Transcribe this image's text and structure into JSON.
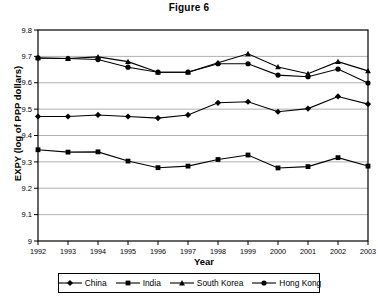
{
  "chart_data": {
    "type": "line",
    "title": "Figure 6",
    "xlabel": "Year",
    "ylabel": "EXPY (log of PPP dollars)",
    "x": [
      1992,
      1993,
      1994,
      1995,
      1996,
      1997,
      1998,
      1999,
      2000,
      2001,
      2002,
      2003
    ],
    "categories": [
      "1992",
      "1993",
      "1994",
      "1995",
      "1996",
      "1997",
      "1998",
      "1999",
      "2000",
      "2001",
      "2002",
      "2003"
    ],
    "xlim": [
      1992,
      2003
    ],
    "ylim": [
      9.0,
      9.8
    ],
    "yticks": [
      "9",
      "9.1",
      "9.2",
      "9.3",
      "9.4",
      "9.5",
      "9.6",
      "9.7",
      "9.8"
    ],
    "ytick_values": [
      9.0,
      9.1,
      9.2,
      9.3,
      9.4,
      9.5,
      9.6,
      9.7,
      9.8
    ],
    "grid": "horizontal",
    "legend_position": "bottom",
    "series": [
      {
        "name": "China",
        "marker": "diamond",
        "color": "#000000",
        "values": [
          9.472,
          9.472,
          9.478,
          9.472,
          9.466,
          9.478,
          9.524,
          9.528,
          9.49,
          9.502,
          9.548,
          9.519
        ]
      },
      {
        "name": "India",
        "marker": "square",
        "color": "#000000",
        "values": [
          9.346,
          9.337,
          9.338,
          9.303,
          9.278,
          9.284,
          9.309,
          9.326,
          9.277,
          9.282,
          9.316,
          9.284
        ]
      },
      {
        "name": "South Korea",
        "marker": "triangle",
        "color": "#000000",
        "values": [
          9.694,
          9.692,
          9.698,
          9.68,
          9.64,
          9.64,
          9.676,
          9.71,
          9.66,
          9.634,
          9.68,
          9.645
        ]
      },
      {
        "name": "Hong Kong",
        "marker": "circle",
        "color": "#000000",
        "values": [
          9.694,
          9.692,
          9.688,
          9.659,
          9.64,
          9.64,
          9.672,
          9.672,
          9.629,
          9.623,
          9.652,
          9.599
        ]
      }
    ]
  },
  "legend": {
    "items": [
      {
        "label": "China",
        "marker": "diamond"
      },
      {
        "label": "India",
        "marker": "square"
      },
      {
        "label": "South Korea",
        "marker": "triangle"
      },
      {
        "label": "Hong Kong",
        "marker": "circle"
      }
    ]
  },
  "colors": {
    "ink": "#000000",
    "grid": "#b0b0b0",
    "axis": "#000000",
    "background": "#ffffff"
  }
}
